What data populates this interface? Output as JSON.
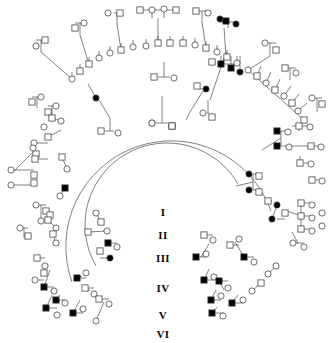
{
  "figure": {
    "type": "pedigree-chart",
    "layout": "circular-radial",
    "width": 334,
    "height": 343,
    "background_color": "#ffffff",
    "line_color": "#3c3c3c",
    "symbol_stroke": "#3c3c3c",
    "affected_fill": "#000000",
    "unaffected_fill": "#ffffff"
  },
  "generation_labels": [
    {
      "id": "gen-1",
      "label": "I",
      "x": 163,
      "y": 212
    },
    {
      "id": "gen-2",
      "label": "II",
      "x": 163,
      "y": 235
    },
    {
      "id": "gen-3",
      "label": "III",
      "x": 163,
      "y": 258
    },
    {
      "id": "gen-4",
      "label": "IV",
      "x": 163,
      "y": 288
    },
    {
      "id": "gen-5",
      "label": "V",
      "x": 163,
      "y": 315
    },
    {
      "id": "gen-6",
      "label": "VI",
      "x": 163,
      "y": 334
    }
  ],
  "legend_meaning": {
    "circle": "female",
    "square": "male",
    "filled": "affected individual",
    "open": "unaffected individual"
  },
  "center": {
    "cx": 167,
    "cy": 200
  },
  "arcs": [
    {
      "name": "generation-ii-arc",
      "r": 72,
      "a0": -175,
      "a1": 8
    },
    {
      "name": "generation-iii-arc",
      "r": 105,
      "a0": -182,
      "a1": 14
    }
  ],
  "founders": [
    {
      "name": "founder-female",
      "shape": "circle",
      "x": 152,
      "y": 123,
      "affected": false
    },
    {
      "name": "founder-male",
      "shape": "square",
      "x": 172,
      "y": 126,
      "affected": false
    }
  ],
  "nodes": [
    {
      "s": "c",
      "x": 152,
      "y": 123,
      "f": 0
    },
    {
      "s": "s",
      "x": 172,
      "y": 126,
      "f": 0
    },
    {
      "s": "s",
      "x": 154,
      "y": 77,
      "f": 0
    },
    {
      "s": "c",
      "x": 174,
      "y": 78,
      "f": 0
    },
    {
      "s": "c",
      "x": 203,
      "y": 113,
      "f": 0
    },
    {
      "s": "s",
      "x": 212,
      "y": 117,
      "f": 0
    },
    {
      "s": "c",
      "x": 118,
      "y": 133,
      "f": 0
    },
    {
      "s": "s",
      "x": 101,
      "y": 131,
      "f": 0
    },
    {
      "s": "c",
      "x": 146,
      "y": 46,
      "f": 0
    },
    {
      "s": "s",
      "x": 158,
      "y": 43,
      "f": 0
    },
    {
      "s": "s",
      "x": 170,
      "y": 43,
      "f": 0
    },
    {
      "s": "c",
      "x": 133,
      "y": 47,
      "f": 0
    },
    {
      "s": "s",
      "x": 121,
      "y": 50,
      "f": 0
    },
    {
      "s": "c",
      "x": 110,
      "y": 53,
      "f": 0
    },
    {
      "s": "s",
      "x": 183,
      "y": 43,
      "f": 0
    },
    {
      "s": "c",
      "x": 195,
      "y": 45,
      "f": 0
    },
    {
      "s": "s",
      "x": 206,
      "y": 48,
      "f": 0
    },
    {
      "s": "c",
      "x": 217,
      "y": 52,
      "f": 0
    },
    {
      "s": "s",
      "x": 227,
      "y": 57,
      "f": 0
    },
    {
      "s": "c",
      "x": 237,
      "y": 63,
      "f": 0
    },
    {
      "s": "c",
      "x": 99,
      "y": 58,
      "f": 0
    },
    {
      "s": "s",
      "x": 89,
      "y": 64,
      "f": 0
    },
    {
      "s": "s",
      "x": 80,
      "y": 71,
      "f": 0
    },
    {
      "s": "c",
      "x": 72,
      "y": 79,
      "f": 0
    },
    {
      "s": "c",
      "x": 108,
      "y": 13,
      "f": 0
    },
    {
      "s": "s",
      "x": 120,
      "y": 13,
      "f": 0
    },
    {
      "s": "s",
      "x": 140,
      "y": 10,
      "f": 0
    },
    {
      "s": "c",
      "x": 152,
      "y": 10,
      "f": 0
    },
    {
      "s": "c",
      "x": 164,
      "y": 9,
      "f": 0
    },
    {
      "s": "s",
      "x": 176,
      "y": 10,
      "f": 0
    },
    {
      "s": "s",
      "x": 196,
      "y": 11,
      "f": 0
    },
    {
      "s": "c",
      "x": 208,
      "y": 13,
      "f": 0
    },
    {
      "s": "s",
      "x": 226,
      "y": 21,
      "f": 1
    },
    {
      "s": "c",
      "x": 236,
      "y": 24,
      "f": 1
    },
    {
      "s": "c",
      "x": 220,
      "y": 19,
      "f": 1
    },
    {
      "s": "c",
      "x": 84,
      "y": 23,
      "f": 0
    },
    {
      "s": "s",
      "x": 75,
      "y": 28,
      "f": 0
    },
    {
      "s": "s",
      "x": 45,
      "y": 40,
      "f": 0
    },
    {
      "s": "c",
      "x": 36,
      "y": 46,
      "f": 0
    },
    {
      "s": "c",
      "x": 265,
      "y": 43,
      "f": 0
    },
    {
      "s": "s",
      "x": 276,
      "y": 50,
      "f": 0
    },
    {
      "s": "s",
      "x": 221,
      "y": 64,
      "f": 1
    },
    {
      "s": "s",
      "x": 231,
      "y": 68,
      "f": 1
    },
    {
      "s": "c",
      "x": 240,
      "y": 72,
      "f": 1
    },
    {
      "s": "s",
      "x": 212,
      "y": 62,
      "f": 0
    },
    {
      "s": "c",
      "x": 206,
      "y": 89,
      "f": 1
    },
    {
      "s": "s",
      "x": 197,
      "y": 86,
      "f": 0
    },
    {
      "s": "c",
      "x": 96,
      "y": 98,
      "f": 1
    },
    {
      "s": "c",
      "x": 248,
      "y": 70,
      "f": 0
    },
    {
      "s": "s",
      "x": 257,
      "y": 76,
      "f": 0
    },
    {
      "s": "c",
      "x": 266,
      "y": 83,
      "f": 0
    },
    {
      "s": "s",
      "x": 275,
      "y": 90,
      "f": 0
    },
    {
      "s": "c",
      "x": 284,
      "y": 96,
      "f": 0
    },
    {
      "s": "s",
      "x": 292,
      "y": 103,
      "f": 0
    },
    {
      "s": "c",
      "x": 298,
      "y": 111,
      "f": 0
    },
    {
      "s": "s",
      "x": 304,
      "y": 120,
      "f": 0
    },
    {
      "s": "s",
      "x": 285,
      "y": 68,
      "f": 0
    },
    {
      "s": "c",
      "x": 296,
      "y": 73,
      "f": 0
    },
    {
      "s": "c",
      "x": 312,
      "y": 98,
      "f": 0
    },
    {
      "s": "s",
      "x": 322,
      "y": 104,
      "f": 0
    },
    {
      "s": "s",
      "x": 277,
      "y": 131,
      "f": 1
    },
    {
      "s": "c",
      "x": 288,
      "y": 132,
      "f": 0
    },
    {
      "s": "s",
      "x": 277,
      "y": 146,
      "f": 1
    },
    {
      "s": "c",
      "x": 289,
      "y": 147,
      "f": 0
    },
    {
      "s": "s",
      "x": 299,
      "y": 126,
      "f": 0
    },
    {
      "s": "c",
      "x": 310,
      "y": 127,
      "f": 0
    },
    {
      "s": "s",
      "x": 311,
      "y": 146,
      "f": 0
    },
    {
      "s": "c",
      "x": 321,
      "y": 147,
      "f": 0
    },
    {
      "s": "s",
      "x": 300,
      "y": 163,
      "f": 0
    },
    {
      "s": "c",
      "x": 311,
      "y": 164,
      "f": 0
    },
    {
      "s": "s",
      "x": 312,
      "y": 180,
      "f": 0
    },
    {
      "s": "c",
      "x": 322,
      "y": 181,
      "f": 0
    },
    {
      "s": "c",
      "x": 249,
      "y": 174,
      "f": 1
    },
    {
      "s": "s",
      "x": 259,
      "y": 176,
      "f": 0
    },
    {
      "s": "c",
      "x": 249,
      "y": 190,
      "f": 1
    },
    {
      "s": "s",
      "x": 259,
      "y": 192,
      "f": 0
    },
    {
      "s": "c",
      "x": 277,
      "y": 205,
      "f": 1
    },
    {
      "s": "s",
      "x": 268,
      "y": 201,
      "f": 0
    },
    {
      "s": "c",
      "x": 272,
      "y": 219,
      "f": 1
    },
    {
      "s": "s",
      "x": 285,
      "y": 213,
      "f": 0
    },
    {
      "s": "s",
      "x": 301,
      "y": 203,
      "f": 0
    },
    {
      "s": "c",
      "x": 312,
      "y": 205,
      "f": 0
    },
    {
      "s": "s",
      "x": 301,
      "y": 216,
      "f": 0
    },
    {
      "s": "c",
      "x": 312,
      "y": 218,
      "f": 0
    },
    {
      "s": "s",
      "x": 301,
      "y": 229,
      "f": 0
    },
    {
      "s": "c",
      "x": 312,
      "y": 231,
      "f": 0
    },
    {
      "s": "c",
      "x": 322,
      "y": 213,
      "f": 0
    },
    {
      "s": "c",
      "x": 322,
      "y": 226,
      "f": 0
    },
    {
      "s": "c",
      "x": 293,
      "y": 243,
      "f": 0
    },
    {
      "s": "c",
      "x": 304,
      "y": 247,
      "f": 0
    },
    {
      "s": "c",
      "x": 41,
      "y": 97,
      "f": 0
    },
    {
      "s": "s",
      "x": 32,
      "y": 102,
      "f": 0
    },
    {
      "s": "c",
      "x": 56,
      "y": 106,
      "f": 0
    },
    {
      "s": "s",
      "x": 48,
      "y": 112,
      "f": 0
    },
    {
      "s": "c",
      "x": 61,
      "y": 121,
      "f": 0
    },
    {
      "s": "s",
      "x": 52,
      "y": 118,
      "f": 0
    },
    {
      "s": "c",
      "x": 44,
      "y": 127,
      "f": 0
    },
    {
      "s": "s",
      "x": 48,
      "y": 137,
      "f": 0
    },
    {
      "s": "c",
      "x": 34,
      "y": 143,
      "f": 0
    },
    {
      "s": "s",
      "x": 36,
      "y": 154,
      "f": 0
    },
    {
      "s": "c",
      "x": 33,
      "y": 148,
      "f": 0
    },
    {
      "s": "s",
      "x": 35,
      "y": 159,
      "f": 0
    },
    {
      "s": "c",
      "x": 11,
      "y": 170,
      "f": 0
    },
    {
      "s": "c",
      "x": 11,
      "y": 185,
      "f": 0
    },
    {
      "s": "s",
      "x": 34,
      "y": 175,
      "f": 0
    },
    {
      "s": "s",
      "x": 34,
      "y": 183,
      "f": 0
    },
    {
      "s": "s",
      "x": 62,
      "y": 157,
      "f": 0
    },
    {
      "s": "c",
      "x": 67,
      "y": 169,
      "f": 0
    },
    {
      "s": "s",
      "x": 65,
      "y": 188,
      "f": 1
    },
    {
      "s": "c",
      "x": 60,
      "y": 196,
      "f": 0
    },
    {
      "s": "c",
      "x": 36,
      "y": 205,
      "f": 0
    },
    {
      "s": "s",
      "x": 46,
      "y": 211,
      "f": 0
    },
    {
      "s": "c",
      "x": 41,
      "y": 221,
      "f": 0
    },
    {
      "s": "s",
      "x": 50,
      "y": 215,
      "f": 0
    },
    {
      "s": "c",
      "x": 20,
      "y": 228,
      "f": 0
    },
    {
      "s": "s",
      "x": 28,
      "y": 236,
      "f": 0
    },
    {
      "s": "s",
      "x": 48,
      "y": 220,
      "f": 0
    },
    {
      "s": "c",
      "x": 56,
      "y": 228,
      "f": 0
    },
    {
      "s": "s",
      "x": 53,
      "y": 234,
      "f": 0
    },
    {
      "s": "c",
      "x": 56,
      "y": 243,
      "f": 0
    },
    {
      "s": "c",
      "x": 96,
      "y": 213,
      "f": 0
    },
    {
      "s": "s",
      "x": 101,
      "y": 222,
      "f": 0
    },
    {
      "s": "c",
      "x": 107,
      "y": 231,
      "f": 0
    },
    {
      "s": "s",
      "x": 88,
      "y": 232,
      "f": 0
    },
    {
      "s": "s",
      "x": 108,
      "y": 243,
      "f": 1
    },
    {
      "s": "c",
      "x": 117,
      "y": 247,
      "f": 0
    },
    {
      "s": "c",
      "x": 110,
      "y": 258,
      "f": 1
    },
    {
      "s": "s",
      "x": 100,
      "y": 251,
      "f": 0
    },
    {
      "s": "s",
      "x": 37,
      "y": 258,
      "f": 0
    },
    {
      "s": "c",
      "x": 45,
      "y": 266,
      "f": 0
    },
    {
      "s": "c",
      "x": 35,
      "y": 280,
      "f": 0
    },
    {
      "s": "s",
      "x": 44,
      "y": 273,
      "f": 0
    },
    {
      "s": "s",
      "x": 44,
      "y": 287,
      "f": 1
    },
    {
      "s": "c",
      "x": 54,
      "y": 291,
      "f": 0
    },
    {
      "s": "s",
      "x": 56,
      "y": 300,
      "f": 1
    },
    {
      "s": "c",
      "x": 65,
      "y": 303,
      "f": 0
    },
    {
      "s": "s",
      "x": 46,
      "y": 308,
      "f": 1
    },
    {
      "s": "c",
      "x": 57,
      "y": 315,
      "f": 0
    },
    {
      "s": "s",
      "x": 73,
      "y": 313,
      "f": 1
    },
    {
      "s": "c",
      "x": 83,
      "y": 309,
      "f": 0
    },
    {
      "s": "s",
      "x": 85,
      "y": 288,
      "f": 0
    },
    {
      "s": "c",
      "x": 94,
      "y": 294,
      "f": 0
    },
    {
      "s": "s",
      "x": 77,
      "y": 278,
      "f": 1
    },
    {
      "s": "c",
      "x": 86,
      "y": 273,
      "f": 0
    },
    {
      "s": "s",
      "x": 99,
      "y": 299,
      "f": 0
    },
    {
      "s": "c",
      "x": 109,
      "y": 304,
      "f": 0
    },
    {
      "s": "c",
      "x": 96,
      "y": 321,
      "f": 0
    },
    {
      "s": "s",
      "x": 196,
      "y": 257,
      "f": 1
    },
    {
      "s": "c",
      "x": 206,
      "y": 254,
      "f": 0
    },
    {
      "s": "s",
      "x": 204,
      "y": 235,
      "f": 0
    },
    {
      "s": "c",
      "x": 213,
      "y": 240,
      "f": 0
    },
    {
      "s": "s",
      "x": 230,
      "y": 245,
      "f": 0
    },
    {
      "s": "c",
      "x": 239,
      "y": 239,
      "f": 0
    },
    {
      "s": "s",
      "x": 244,
      "y": 257,
      "f": 1
    },
    {
      "s": "c",
      "x": 254,
      "y": 262,
      "f": 0
    },
    {
      "s": "s",
      "x": 204,
      "y": 280,
      "f": 1
    },
    {
      "s": "c",
      "x": 214,
      "y": 277,
      "f": 0
    },
    {
      "s": "s",
      "x": 219,
      "y": 281,
      "f": 1
    },
    {
      "s": "c",
      "x": 228,
      "y": 288,
      "f": 0
    },
    {
      "s": "s",
      "x": 211,
      "y": 300,
      "f": 1
    },
    {
      "s": "c",
      "x": 221,
      "y": 296,
      "f": 0
    },
    {
      "s": "s",
      "x": 212,
      "y": 313,
      "f": 1
    },
    {
      "s": "c",
      "x": 223,
      "y": 316,
      "f": 0
    },
    {
      "s": "s",
      "x": 232,
      "y": 303,
      "f": 1
    },
    {
      "s": "c",
      "x": 243,
      "y": 300,
      "f": 0
    },
    {
      "s": "c",
      "x": 252,
      "y": 291,
      "f": 0
    },
    {
      "s": "s",
      "x": 261,
      "y": 283,
      "f": 0
    },
    {
      "s": "c",
      "x": 268,
      "y": 274,
      "f": 0
    },
    {
      "s": "c",
      "x": 276,
      "y": 266,
      "f": 0
    }
  ]
}
